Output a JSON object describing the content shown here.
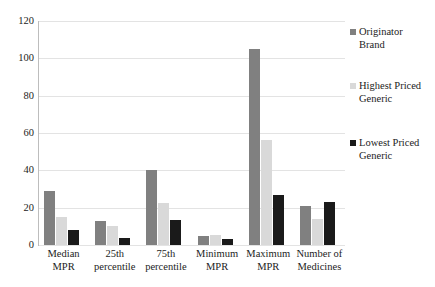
{
  "chart_data": {
    "type": "bar",
    "title": "",
    "subtitle": "",
    "xlabel": "",
    "ylabel": "",
    "grid": true,
    "legend_position": "right",
    "ylim": [
      0,
      120
    ],
    "yticks": [
      0,
      20,
      40,
      60,
      80,
      100,
      120
    ],
    "ytick_labels": [
      "0",
      "20",
      "40",
      "60",
      "80",
      "100",
      "120"
    ],
    "categories": [
      "Median MPR",
      "25th percentile",
      "75th percentile",
      "Minimum MPR",
      "Maximum MPR",
      "Number of Medicines"
    ],
    "category_lines": [
      [
        "Median",
        "MPR"
      ],
      [
        "25th",
        "percentile"
      ],
      [
        "75th",
        "percentile"
      ],
      [
        "Minimum",
        "MPR"
      ],
      [
        "Maximum",
        "MPR"
      ],
      [
        "Number of",
        "Medicines"
      ]
    ],
    "series": [
      {
        "name": "Originator Brand",
        "legend_lines": [
          "Originator",
          "Brand"
        ],
        "color": "#808080",
        "values": [
          29,
          13,
          40,
          5,
          105,
          21
        ]
      },
      {
        "name": "Highest Priced Generic",
        "legend_lines": [
          "Highest Priced",
          "Generic"
        ],
        "color": "#d9d9d9",
        "values": [
          15,
          10,
          22.5,
          5.5,
          56,
          14
        ]
      },
      {
        "name": "Lowest Priced Generic",
        "legend_lines": [
          "Lowest Priced",
          "Generic"
        ],
        "color": "#1a1a1a",
        "values": [
          8,
          4,
          13.5,
          3,
          27,
          23
        ]
      }
    ]
  },
  "colors": {
    "originator_brand": "#808080",
    "highest_priced_generic": "#d9d9d9",
    "lowest_priced_generic": "#1a1a1a",
    "gridline": "#e3e3e3",
    "text": "#1c1c1c",
    "background": "#ffffff"
  }
}
